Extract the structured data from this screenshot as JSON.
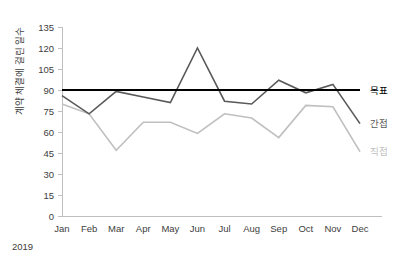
{
  "chart_data": {
    "type": "line",
    "title": "",
    "xlabel": "",
    "ylabel": "계약 체결에 걸린 일수",
    "x_period_label": "2019",
    "categories": [
      "Jan",
      "Feb",
      "Mar",
      "Apr",
      "May",
      "Jun",
      "Jul",
      "Aug",
      "Sep",
      "Oct",
      "Nov",
      "Dec"
    ],
    "ylim": [
      0,
      135
    ],
    "ytick_step": 15,
    "ytick_labels": [
      "135",
      "120",
      "105",
      "90",
      "75",
      "60",
      "45",
      "30",
      "15",
      "0"
    ],
    "grid": false,
    "legend_position": "right",
    "series": [
      {
        "name": "목표",
        "color": "#000000",
        "width": 2.2,
        "values": [
          90,
          90,
          90,
          90,
          90,
          90,
          90,
          90,
          90,
          90,
          90,
          90
        ]
      },
      {
        "name": "간접",
        "color": "#595959",
        "width": 1.6,
        "values": [
          86,
          73,
          89,
          85,
          81,
          120,
          82,
          80,
          97,
          88,
          94,
          66
        ]
      },
      {
        "name": "직접",
        "color": "#bfbfbf",
        "width": 1.6,
        "values": [
          80,
          73,
          47,
          67,
          67,
          59,
          73,
          70,
          56,
          79,
          78,
          46
        ]
      }
    ]
  },
  "colors": {
    "axis": "#bfbfbf",
    "text": "#404040",
    "background": "#ffffff"
  }
}
